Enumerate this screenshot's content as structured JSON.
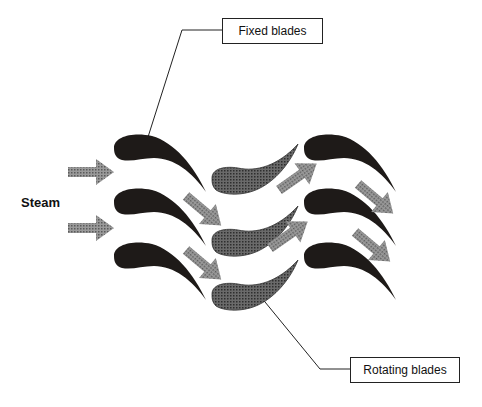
{
  "diagram": {
    "type": "steam turbine blade stages",
    "labels": {
      "fixed": "Fixed blades",
      "rotating": "Rotating blades",
      "input": "Steam"
    },
    "colors": {
      "fixed_blade": "#1e1a18",
      "rotating_blade": "#555555",
      "arrow": "#8a8a8a",
      "line": "#222222"
    },
    "stages": [
      {
        "name": "fixed-stage-1",
        "blade_count": 3
      },
      {
        "name": "rotating-stage",
        "blade_count": 3
      },
      {
        "name": "fixed-stage-2",
        "blade_count": 3
      }
    ]
  }
}
